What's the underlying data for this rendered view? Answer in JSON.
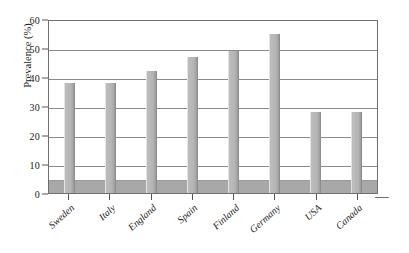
{
  "chart_data": {
    "type": "bar",
    "title": "",
    "subtitle": "",
    "xlabel": "",
    "ylabel": "Prevalence (%)",
    "ylim": [
      0,
      60
    ],
    "ytick_step": 10,
    "ytick_labels": [
      "60",
      "50",
      "40",
      "30",
      "20",
      "10",
      "0"
    ],
    "grid": true,
    "legend": "none",
    "categories": [
      "Sweden",
      "Italy",
      "England",
      "Spain",
      "Finland",
      "Germany",
      "USA",
      "Canada"
    ],
    "values": [
      38,
      38,
      42,
      47,
      49,
      55,
      28,
      28
    ],
    "baseline_band_value": 4,
    "bar_color": "#b4b4b4",
    "bar_edge_color": "#8d8d8d",
    "floor_band_color": "#a8a8a8",
    "frame_color": "#6f6f6f",
    "gridline_color": "#8a8a8a",
    "text_color": "#1a1a1a"
  }
}
